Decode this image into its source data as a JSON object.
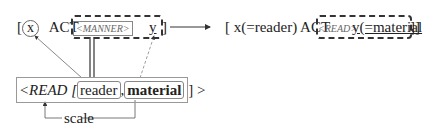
{
  "left_structure": {
    "open_bracket": "[",
    "x_var": "x",
    "act": "ACT",
    "manner_label": "<MANNER>",
    "y_var": "y",
    "close_bracket": "]"
  },
  "right_structure": {
    "open_bracket": "[",
    "x_part": "x(=reader) ACT",
    "read_label": "<READ>",
    "y_part": "y(=material",
    "close_bracket": "]]"
  },
  "root_box": {
    "prefix": "<READ [",
    "arg1": "reader",
    "comma": ",",
    "arg2": "material",
    "suffix": "] >"
  },
  "scale_label": "scale",
  "colors": {
    "line": "#333333",
    "box_border": "#999999",
    "faint_text": "#666666"
  }
}
